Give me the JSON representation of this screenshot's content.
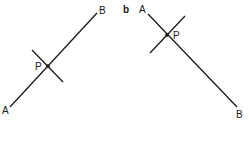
{
  "diagrams": [
    {
      "id": "a",
      "panel_label": "",
      "labels": {
        "A": "A",
        "B": "B",
        "P": "P"
      },
      "line": {
        "x1": 10,
        "y1": 107,
        "x2": 97,
        "y2": 13
      },
      "perpendicular": {
        "x1": 32,
        "y1": 50,
        "x2": 63,
        "y2": 82
      },
      "point_p": {
        "x": 48,
        "y": 66
      }
    },
    {
      "id": "b",
      "panel_label": "b",
      "labels": {
        "A": "A",
        "B": "B",
        "P": "P"
      },
      "line": {
        "x1": 148,
        "y1": 14,
        "x2": 237,
        "y2": 107
      },
      "perpendicular": {
        "x1": 150,
        "y1": 53,
        "x2": 185,
        "y2": 16
      },
      "point_p": {
        "x": 167,
        "y": 35
      }
    }
  ],
  "colors": {
    "stroke": "#1a1a1a",
    "background": "#ffffff"
  }
}
